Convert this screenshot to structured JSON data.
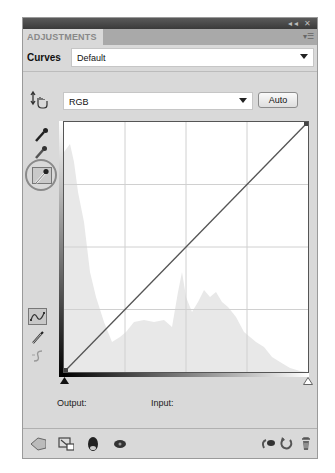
{
  "window": {
    "controls": [
      "collapse-icon",
      "close-icon"
    ],
    "tab_label": "ADJUSTMENTS",
    "panel_menu_icon": "panel-menu-icon"
  },
  "preset": {
    "label": "Curves",
    "value": "Default"
  },
  "channel": {
    "value": "RGB",
    "auto_label": "Auto"
  },
  "left_tools": [
    {
      "name": "on-image-adjustment-icon"
    },
    {
      "name": "black-point-eyedropper-icon"
    },
    {
      "name": "gray-point-eyedropper-icon"
    },
    {
      "name": "white-point-eyedropper-icon",
      "selected": true
    },
    {
      "name": "curve-points-icon",
      "selected": true
    },
    {
      "name": "pencil-draw-icon"
    },
    {
      "name": "smooth-curve-icon",
      "disabled": true
    }
  ],
  "curve": {
    "points": [
      [
        0,
        0
      ],
      [
        255,
        255
      ]
    ],
    "grid_divisions": 4
  },
  "readout": {
    "output_label": "Output:",
    "input_label": "Input:"
  },
  "bottom_bar": {
    "left": [
      "return-to-list-icon",
      "clip-to-layer-icon",
      "layer-visibility-icon",
      "view-previous-state-icon"
    ],
    "right": [
      "reset-to-previous-icon",
      "reset-icon",
      "delete-adjustment-icon"
    ]
  },
  "colors": {
    "panel_bg": "#d9d9d9",
    "titlebar": "#3a3a3a",
    "tab_strip": "#a9a9a9",
    "histogram": "#e6e6e6",
    "curve_line": "#555555"
  }
}
